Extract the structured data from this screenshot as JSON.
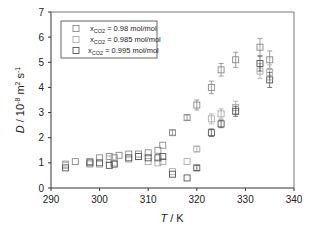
{
  "chart_data": {
    "type": "scatter",
    "title": "",
    "xlabel": "T / K",
    "ylabel": "D / 10^-8 m^2 s^-1",
    "xlim": [
      290,
      340
    ],
    "ylim": [
      0,
      7
    ],
    "xticks": [
      290,
      300,
      310,
      320,
      330,
      340
    ],
    "yticks": [
      0,
      1,
      2,
      3,
      4,
      5,
      6,
      7
    ],
    "grid": false,
    "legend_position": "upper left",
    "series": [
      {
        "name": "xCO2 = 0.98 mol/mol",
        "color": "#888888",
        "x": [
          293,
          295,
          298,
          300,
          302,
          303,
          304,
          306,
          308,
          310,
          312,
          313,
          315,
          318,
          320,
          323,
          325,
          328,
          333,
          335
        ],
        "y": [
          0.95,
          1.05,
          1.05,
          1.2,
          1.25,
          1.2,
          1.3,
          1.35,
          1.35,
          1.4,
          1.5,
          1.7,
          2.2,
          2.8,
          3.3,
          4.0,
          4.7,
          5.1,
          5.6,
          5.1
        ],
        "yerr": [
          0,
          0,
          0,
          0,
          0,
          0,
          0,
          0,
          0,
          0,
          0,
          0,
          0.1,
          0.1,
          0.2,
          0.25,
          0.25,
          0.3,
          0.35,
          0.35
        ]
      },
      {
        "name": "xCO2 = 0.985 mol/mol",
        "color": "#aaaaaa",
        "x": [
          293,
          298,
          300,
          302,
          303,
          306,
          308,
          310,
          312,
          313,
          315,
          318,
          320,
          323,
          325,
          328,
          333,
          335
        ],
        "y": [
          0.9,
          0.95,
          0.95,
          1.15,
          1.0,
          1.15,
          1.25,
          1.05,
          1.0,
          1.05,
          0.65,
          1.05,
          1.55,
          2.75,
          2.95,
          3.2,
          4.65,
          4.6
        ],
        "yerr": [
          0,
          0,
          0,
          0,
          0,
          0,
          0,
          0,
          0,
          0,
          0,
          0,
          0.1,
          0.2,
          0.2,
          0.25,
          0.3,
          0.3
        ]
      },
      {
        "name": "xCO2 = 0.995 mol/mol",
        "color": "#555555",
        "x": [
          293,
          298,
          300,
          302,
          303,
          306,
          308,
          310,
          312,
          313,
          315,
          318,
          320,
          323,
          325,
          328,
          333,
          335
        ],
        "y": [
          0.8,
          1.0,
          1.0,
          0.9,
          0.95,
          1.2,
          1.25,
          1.2,
          1.2,
          1.25,
          0.55,
          0.4,
          0.8,
          2.2,
          2.55,
          3.05,
          4.95,
          4.3
        ],
        "yerr": [
          0,
          0,
          0,
          0,
          0,
          0,
          0,
          0,
          0,
          0,
          0,
          0,
          0.1,
          0.15,
          0.15,
          0.2,
          0.3,
          0.3
        ]
      }
    ]
  },
  "legend": {
    "items": [
      {
        "label_pre": "x",
        "label_sub": "CO2",
        "label_post": " = 0.98 mol/mol"
      },
      {
        "label_pre": "x",
        "label_sub": "CO2",
        "label_post": " = 0.985 mol/mol"
      },
      {
        "label_pre": "x",
        "label_sub": "CO2",
        "label_post": " = 0.995 mol/mol"
      }
    ]
  },
  "axes": {
    "xlabel_italic": "T",
    "xlabel_rest": " / K",
    "ylabel_italic": "D",
    "ylabel_rest": " / 10",
    "ylabel_exp1": "-8",
    "ylabel_mid": " m",
    "ylabel_exp2": "2",
    "ylabel_mid2": " s",
    "ylabel_exp3": "-1"
  }
}
